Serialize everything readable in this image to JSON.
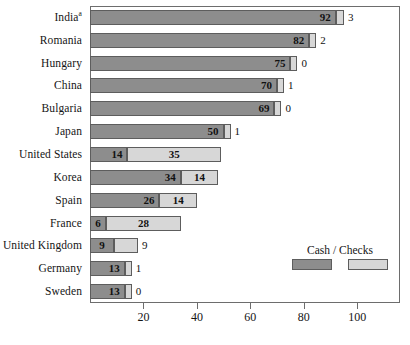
{
  "chart_data": {
    "type": "bar",
    "orientation": "horizontal",
    "stacked": true,
    "title": "",
    "xlabel": "",
    "ylabel": "",
    "xlim": [
      0,
      116
    ],
    "xticks": [
      20,
      40,
      60,
      80,
      100
    ],
    "grid": false,
    "legend": {
      "title": "Cash / Checks",
      "position": "inside-right",
      "entries": [
        {
          "name": "Cash",
          "color": "#8d8d8d"
        },
        {
          "name": "Checks",
          "color": "#d7d7d7"
        }
      ]
    },
    "categories": [
      "India",
      "Romania",
      "Hungary",
      "China",
      "Bulgaria",
      "Japan",
      "United States",
      "Korea",
      "Spain",
      "France",
      "United Kingdom",
      "Germany",
      "Sweden"
    ],
    "category_footnotes": {
      "India": "a"
    },
    "series": [
      {
        "name": "Cash",
        "color": "#8d8d8d",
        "values": [
          92,
          82,
          75,
          70,
          69,
          50,
          14,
          34,
          26,
          6,
          9,
          13,
          13
        ]
      },
      {
        "name": "Checks",
        "color": "#d7d7d7",
        "values": [
          3,
          2,
          0,
          1,
          0,
          1,
          35,
          14,
          14,
          28,
          9,
          1,
          0
        ]
      }
    ],
    "rows": [
      {
        "category": "India",
        "footnote": "a",
        "cash": 92,
        "checks": 3
      },
      {
        "category": "Romania",
        "footnote": "",
        "cash": 82,
        "checks": 2
      },
      {
        "category": "Hungary",
        "footnote": "",
        "cash": 75,
        "checks": 0
      },
      {
        "category": "China",
        "footnote": "",
        "cash": 70,
        "checks": 1
      },
      {
        "category": "Bulgaria",
        "footnote": "",
        "cash": 69,
        "checks": 0
      },
      {
        "category": "Japan",
        "footnote": "",
        "cash": 50,
        "checks": 1
      },
      {
        "category": "United States",
        "footnote": "",
        "cash": 14,
        "checks": 35
      },
      {
        "category": "Korea",
        "footnote": "",
        "cash": 34,
        "checks": 14
      },
      {
        "category": "Spain",
        "footnote": "",
        "cash": 26,
        "checks": 14
      },
      {
        "category": "France",
        "footnote": "",
        "cash": 6,
        "checks": 28
      },
      {
        "category": "United Kingdom",
        "footnote": "",
        "cash": 9,
        "checks": 9
      },
      {
        "category": "Germany",
        "footnote": "",
        "cash": 13,
        "checks": 1
      },
      {
        "category": "Sweden",
        "footnote": "",
        "cash": 13,
        "checks": 0
      }
    ]
  }
}
